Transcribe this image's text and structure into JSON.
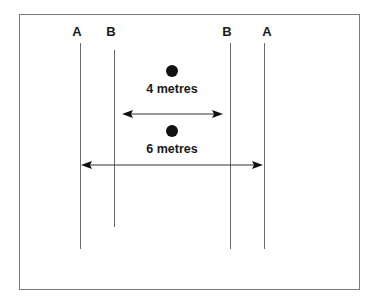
{
  "diagram": {
    "labels": {
      "a_left": "A",
      "b_left": "B",
      "b_right": "B",
      "a_right": "A"
    },
    "measurements": {
      "inner": "4 metres",
      "outer": "6 metres"
    },
    "colors": {
      "frame": "#7a7a7a",
      "lines": "#6a6a6a",
      "text": "#1a1a1a",
      "dots": "#111111"
    }
  }
}
